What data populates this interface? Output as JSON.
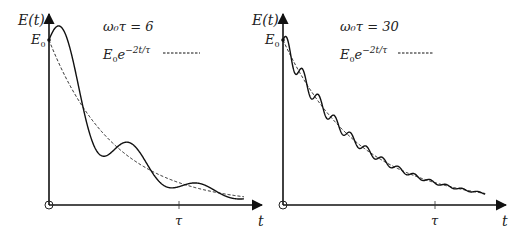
{
  "panels": [
    {
      "id": "left",
      "y_axis_label": "E(t)",
      "x_axis_label": "t",
      "y_tick_label": "E",
      "y_tick_sub": "0",
      "x_tick_label": "τ",
      "annotation_param": "ω₀τ = 6",
      "legend_expr_base": "E",
      "legend_expr_sub": "0",
      "legend_expr_e": "e",
      "legend_expr_exp": "−2t/τ",
      "omega0_tau": 6,
      "t_max_over_tau": 1.5
    },
    {
      "id": "right",
      "y_axis_label": "E(t)",
      "x_axis_label": "t",
      "y_tick_label": "E",
      "y_tick_sub": "0",
      "x_tick_label": "τ",
      "annotation_param": "ω₀τ = 30",
      "legend_expr_base": "E",
      "legend_expr_sub": "0",
      "legend_expr_e": "e",
      "legend_expr_exp": "−2t/τ",
      "omega0_tau": 30,
      "t_max_over_tau": 1.33
    }
  ],
  "chart_data": [
    {
      "type": "line",
      "title": "ω₀τ = 6",
      "xlabel": "t",
      "ylabel": "E(t)",
      "x_ticks": [
        "τ"
      ],
      "y_ticks": [
        "E₀"
      ],
      "series": [
        {
          "name": "E(t) (damped oscillator energy)",
          "style": "solid",
          "formula": "E0*exp(-2t/tau)*(1+A*sin(2*omega0*t))",
          "omega0_tau": 6
        },
        {
          "name": "E₀e^(−2t/τ)",
          "style": "dashed",
          "formula": "E0*exp(-2t/tau)"
        }
      ],
      "legend": "top-right"
    },
    {
      "type": "line",
      "title": "ω₀τ = 30",
      "xlabel": "t",
      "ylabel": "E(t)",
      "x_ticks": [
        "τ"
      ],
      "y_ticks": [
        "E₀"
      ],
      "series": [
        {
          "name": "E(t) (damped oscillator energy)",
          "style": "solid",
          "formula": "E0*exp(-2t/tau)*(1+A*sin(2*omega0*t))",
          "omega0_tau": 30
        },
        {
          "name": "E₀e^(−2t/τ)",
          "style": "dashed",
          "formula": "E0*exp(-2t/tau)"
        }
      ],
      "legend": "top-right"
    }
  ]
}
